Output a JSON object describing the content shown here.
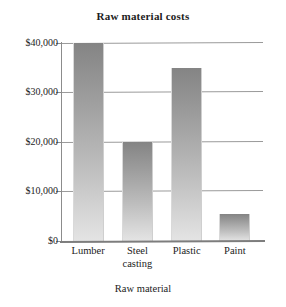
{
  "chart_data": {
    "type": "bar",
    "title": "Raw material costs",
    "xlabel": "Raw material",
    "ylabel": "",
    "categories": [
      "Lumber",
      "Steel casting",
      "Plastic",
      "Paint"
    ],
    "category_lines": [
      [
        "Lumber"
      ],
      [
        "Steel",
        "casting"
      ],
      [
        "Plastic"
      ],
      [
        "Paint"
      ]
    ],
    "values": [
      40000,
      20000,
      35000,
      5500
    ],
    "ylim": [
      0,
      40000
    ],
    "ytick_values": [
      0,
      10000,
      20000,
      30000,
      40000
    ],
    "ytick_labels": [
      "$0",
      "$10,000",
      "$20,000",
      "$30,000",
      "$40,000"
    ],
    "grid": true,
    "grid_axis": "y",
    "legend": false,
    "bar_fill": "#9d9d9d",
    "bar_fill_top": "#848484",
    "bar_fill_bottom": "#e4e4e4",
    "axis_color": "#8c8c8c",
    "text_color": "#1c1c1c",
    "background": "#ffffff"
  },
  "ytick_0": {
    "label": "$0"
  },
  "ytick_1": {
    "label": "$10,000"
  },
  "ytick_2": {
    "label": "$20,000"
  },
  "ytick_3": {
    "label": "$30,000"
  },
  "ytick_4": {
    "label": "$40,000"
  },
  "bar_0": {
    "label": "Lumber",
    "line2": ""
  },
  "bar_1": {
    "label": "Steel",
    "line2": "casting"
  },
  "bar_2": {
    "label": "Plastic",
    "line2": ""
  },
  "bar_3": {
    "label": "Paint",
    "line2": ""
  }
}
